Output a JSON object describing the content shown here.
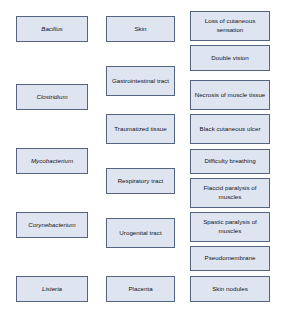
{
  "diagram": {
    "type": "three-column-matching-diagram",
    "colors": {
      "box_fill": "#dfe5f0",
      "box_border": "#56657f",
      "background": "#ffffff",
      "text": "#10131a"
    },
    "columns": [
      {
        "name": "genus",
        "style": "italic",
        "items": [
          {
            "label": "Bacillus"
          },
          {
            "label": "Clostridium"
          },
          {
            "label": "Mycobacterium"
          },
          {
            "label": "Corynebacterium"
          },
          {
            "label": "Listeria"
          }
        ]
      },
      {
        "name": "portal-of-entry",
        "style": "normal",
        "items": [
          {
            "label": "Skin"
          },
          {
            "label": "Gastrointestinal tract"
          },
          {
            "label": "Traumatized tissue"
          },
          {
            "label": "Respiratory tract"
          },
          {
            "label": "Urogenital tract"
          },
          {
            "label": "Placenta"
          }
        ]
      },
      {
        "name": "symptom",
        "style": "normal",
        "items": [
          {
            "label": "Loss of cutaneous sensation"
          },
          {
            "label": "Double vision"
          },
          {
            "label": "Necrosis of muscle tissue"
          },
          {
            "label": "Black cutaneous ulcer"
          },
          {
            "label": "Difficulty breathing"
          },
          {
            "label": "Flaccid paralysis of muscles"
          },
          {
            "label": "Spastic paralysis of muscles"
          },
          {
            "label": "Pseudomembrane"
          },
          {
            "label": "Skin nodules"
          }
        ]
      }
    ]
  }
}
